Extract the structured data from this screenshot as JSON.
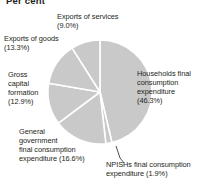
{
  "axis_title": "Per cent",
  "colors": {
    "slice_fill": "#c9c9c9",
    "slice_edge": "#ffffff",
    "text": "#231f20",
    "leader_line": "#231f20",
    "background": "#ffffff"
  },
  "labels": {
    "households": "Households final\nconsumption\nexpenditure\n(46.3%)",
    "npishs": "NPISHs final consumption\nexpenditure (1.9%)",
    "general_government": "General\ngovernment\nfinal consumption\nexpenditure (16.6%)",
    "gross_capital_formation": "Gross\ncapital\nformation\n(12.9%)",
    "exports_of_goods": "Exports of goods\n(13.3%)",
    "exports_of_services": "Exports of services\n(9.0%)"
  },
  "chart_data": {
    "type": "pie",
    "title": "Per cent",
    "xlabel": "",
    "ylabel": "Per cent",
    "units": "percent",
    "start_angle_deg": 0,
    "direction": "clockwise",
    "legend": "none",
    "grid": false,
    "categories": [
      "Households final consumption expenditure",
      "NPISHs final consumption expenditure",
      "General government final consumption expenditure",
      "Gross capital formation",
      "Exports of goods",
      "Exports of services"
    ],
    "values": [
      46.3,
      1.9,
      16.6,
      12.9,
      13.3,
      9.0
    ],
    "slices": [
      {
        "label": "Households final consumption expenditure",
        "value": 46.3,
        "display": "(46.3%)",
        "color": "#c9c9c9"
      },
      {
        "label": "NPISHs final consumption expenditure",
        "value": 1.9,
        "display": "(1.9%)",
        "color": "#c9c9c9"
      },
      {
        "label": "General government final consumption expenditure",
        "value": 16.6,
        "display": "(16.6%)",
        "color": "#c9c9c9"
      },
      {
        "label": "Gross capital formation",
        "value": 12.9,
        "display": "(12.9%)",
        "color": "#c9c9c9"
      },
      {
        "label": "Exports of goods",
        "value": 13.3,
        "display": "(13.3%)",
        "color": "#c9c9c9"
      },
      {
        "label": "Exports of services",
        "value": 9.0,
        "display": "(9.0%)",
        "color": "#c9c9c9"
      }
    ],
    "total": 100.0
  },
  "geometry": {
    "center_x": 100,
    "center_y": 92,
    "radius": 52
  }
}
